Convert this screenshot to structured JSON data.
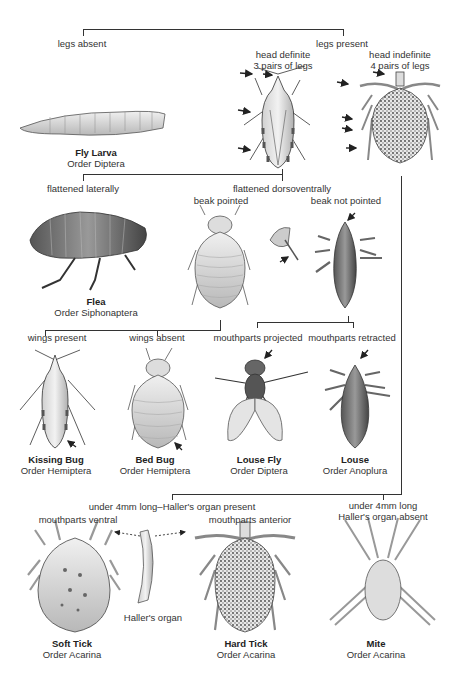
{
  "diagram": {
    "type": "dichotomous identification key"
  },
  "branches": {
    "legs_absent": "legs absent",
    "legs_present": "legs present",
    "head_definite": [
      "head definite",
      "3 pairs of legs"
    ],
    "head_indefinite": [
      "head indefinite",
      "4 pairs of legs"
    ],
    "flattened_laterally": "flattened laterally",
    "flattened_dorsoventrally": "flattened dorsoventrally",
    "beak_pointed": "beak pointed",
    "beak_not_pointed": "beak not pointed",
    "wings_present": "wings present",
    "wings_absent": "wings absent",
    "mouthparts_projected": "mouthparts projected",
    "mouthparts_retracted": "mouthparts retracted",
    "hallers_present": "under 4mm long–Haller's organ present",
    "hallers_absent": [
      "under 4mm long",
      "Haller's organ absent"
    ],
    "mouthparts_ventral": "mouthparts ventral",
    "mouthparts_anterior": "mouthparts anterior",
    "hallers_organ": "Haller's  organ"
  },
  "organisms": [
    {
      "name": "Fly Larva",
      "order": "Order Diptera"
    },
    {
      "name": "Flea",
      "order": "Order Siphonaptera"
    },
    {
      "name": "Kissing Bug",
      "order": "Order Hemiptera"
    },
    {
      "name": "Bed Bug",
      "order": "Order Hemiptera"
    },
    {
      "name": "Louse Fly",
      "order": "Order Diptera"
    },
    {
      "name": "Louse",
      "order": "Order Anoplura"
    },
    {
      "name": "Soft Tick",
      "order": "Order Acarina"
    },
    {
      "name": "Hard Tick",
      "order": "Order Acarina"
    },
    {
      "name": "Mite",
      "order": "Order Acarina"
    }
  ],
  "colors": {
    "line": "#333333",
    "fill_light": "#d8d8d8",
    "fill_mid": "#a8a8a8",
    "fill_dark": "#555555"
  }
}
